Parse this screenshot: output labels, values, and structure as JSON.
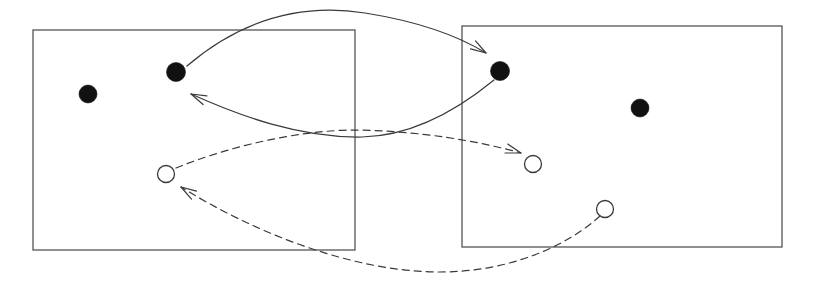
{
  "figure": {
    "canvas": {
      "width": 814,
      "height": 292,
      "background": "#ffffff"
    },
    "style": {
      "stroke_color": "#3a3a3a",
      "frame_stroke_color": "#555555",
      "filled_node_color": "#111111",
      "open_node_fill": "#ffffff",
      "open_node_stroke": "#3a3a3a",
      "stroke_width": 1.2,
      "frame_stroke_width": 1.3,
      "dash_pattern": "7,5"
    },
    "frames": [
      {
        "id": "frame-left",
        "label": "left-frame",
        "x": 33,
        "y": 30,
        "width": 322,
        "height": 220
      },
      {
        "id": "frame-right",
        "label": "right-frame",
        "x": 462,
        "y": 26,
        "width": 320,
        "height": 221
      }
    ],
    "nodes": [
      {
        "id": "b1",
        "kind": "filled",
        "frame": "frame-left",
        "cx": 88,
        "cy": 94,
        "r": 9
      },
      {
        "id": "b2",
        "kind": "filled",
        "frame": "frame-left",
        "cx": 176,
        "cy": 72,
        "r": 9.5
      },
      {
        "id": "b3",
        "kind": "filled",
        "frame": "frame-right",
        "cx": 500,
        "cy": 71,
        "r": 9.5
      },
      {
        "id": "b4",
        "kind": "filled",
        "frame": "frame-right",
        "cx": 640,
        "cy": 108,
        "r": 9
      },
      {
        "id": "w1",
        "kind": "open",
        "frame": "frame-left",
        "cx": 166,
        "cy": 174,
        "r": 8.5
      },
      {
        "id": "w2",
        "kind": "open",
        "frame": "frame-right",
        "cx": 533,
        "cy": 164,
        "r": 8.5
      },
      {
        "id": "w3",
        "kind": "open",
        "frame": "frame-right",
        "cx": 605,
        "cy": 209,
        "r": 8.5
      }
    ],
    "edges": [
      {
        "id": "edge-solid-forward",
        "label": "solid-arc-left-black-to-right-black",
        "style": "solid",
        "from": "b2",
        "to": "b3",
        "path": "M 187 66 C 255 8, 320 6, 365 13 C 415 21, 455 34, 486 53"
      },
      {
        "id": "edge-solid-backward",
        "label": "solid-arc-right-black-to-left-black",
        "style": "solid",
        "from": "b3",
        "to": "b2",
        "path": "M 494 80 C 455 112, 410 136, 362 137 C 300 138, 240 116, 191 94"
      },
      {
        "id": "edge-dashed-forward",
        "label": "dashed-arc-left-white-to-right-white",
        "style": "dashed",
        "from": "w1",
        "to": "w2",
        "path": "M 176 168 C 230 146, 300 130, 356 130 C 420 131, 478 141, 521 153"
      },
      {
        "id": "edge-dashed-backward",
        "label": "dashed-arc-right-white-to-left-white",
        "style": "dashed",
        "from": "w3",
        "to": "w1",
        "path": "M 600 216 C 560 252, 500 272, 440 272 C 350 272, 250 230, 181 187"
      }
    ],
    "arrowheads": [
      {
        "id": "arrow-to-b3",
        "edge": "edge-solid-forward",
        "x": 486,
        "y": 53,
        "angle": 32,
        "style": "solid"
      },
      {
        "id": "arrow-to-b2",
        "edge": "edge-solid-backward",
        "x": 191,
        "y": 94,
        "angle": 204,
        "style": "solid"
      },
      {
        "id": "arrow-to-w2",
        "edge": "edge-dashed-forward",
        "x": 521,
        "y": 153,
        "angle": 17,
        "style": "dashed"
      },
      {
        "id": "arrow-to-w1",
        "edge": "edge-dashed-backward",
        "x": 181,
        "y": 187,
        "angle": 212,
        "style": "dashed"
      }
    ]
  }
}
